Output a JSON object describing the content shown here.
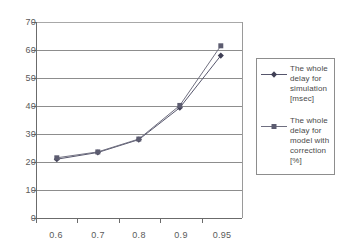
{
  "chart_data": {
    "type": "line",
    "title": "",
    "xlabel": "",
    "ylabel": "",
    "categories": [
      "0.6",
      "0.7",
      "0.8",
      "0.9",
      "0.95"
    ],
    "ylim": [
      0,
      70
    ],
    "yticks": [
      "0",
      "10",
      "20",
      "30",
      "40",
      "50",
      "60",
      "70"
    ],
    "grid": "horizontal",
    "legend_position": "right-outside",
    "series": [
      {
        "name": "The whole delay for simulation [msec]",
        "marker": "diamond",
        "color": "#55556b",
        "values": [
          21.0,
          23.4,
          28.0,
          39.4,
          58.0
        ]
      },
      {
        "name": "The whole delay for model with correction [%]",
        "marker": "square",
        "color": "#6f6f80",
        "values": [
          21.5,
          23.6,
          28.2,
          40.2,
          61.5
        ]
      }
    ]
  },
  "axes": {
    "y_labels": [
      "70",
      "60",
      "50",
      "40",
      "30",
      "20",
      "10",
      "0"
    ],
    "x_labels": [
      "0.6",
      "0.7",
      "0.8",
      "0.9",
      "0.95"
    ]
  },
  "legend": {
    "entries": [
      {
        "label": "The whole delay for simulation [msec]",
        "marker": "diamond-marker-icon"
      },
      {
        "label": "The whole delay for model with correction [%]",
        "marker": "square-marker-icon"
      }
    ]
  },
  "colors": {
    "series1": "#55556b",
    "series2": "#6f6f80",
    "gridline": "#8d8d8d",
    "axis": "#6b6b6b",
    "text": "#5a5a5a",
    "background": "#ffffff"
  }
}
